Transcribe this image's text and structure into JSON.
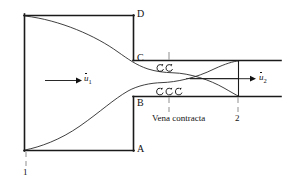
{
  "figure": {
    "type": "fluid-flow-schematic"
  },
  "labels": {
    "corner_d": "D",
    "corner_c": "C",
    "corner_b": "B",
    "corner_a": "A",
    "station_1": "1",
    "station_2": "2",
    "vena_contracta": "Vena contracta",
    "velocity_1_symbol": "u",
    "velocity_1_sub": "1",
    "velocity_2_symbol": "u",
    "velocity_2_sub": "2"
  },
  "colors": {
    "ink": "#111111",
    "stroke": "#1a1a1a",
    "dash": "#9a9a9a",
    "background": "#ffffff"
  },
  "geometry": {
    "upstream_duct": {
      "left": 24,
      "top": 15,
      "right": 134,
      "bottom": 150
    },
    "downstream_duct": {
      "left": 134,
      "top": 60,
      "right": 281,
      "bottom": 97
    },
    "vena_contracta_x": 169,
    "station_2_x": 238,
    "station_1_x": 26
  },
  "eddies": {
    "top_count": 2,
    "bottom_count": 3
  },
  "arrows": {
    "inlet": {
      "x1": 45,
      "x2": 78,
      "y": 80
    },
    "outlet": {
      "x1": 190,
      "x2": 253,
      "y": 81
    }
  }
}
